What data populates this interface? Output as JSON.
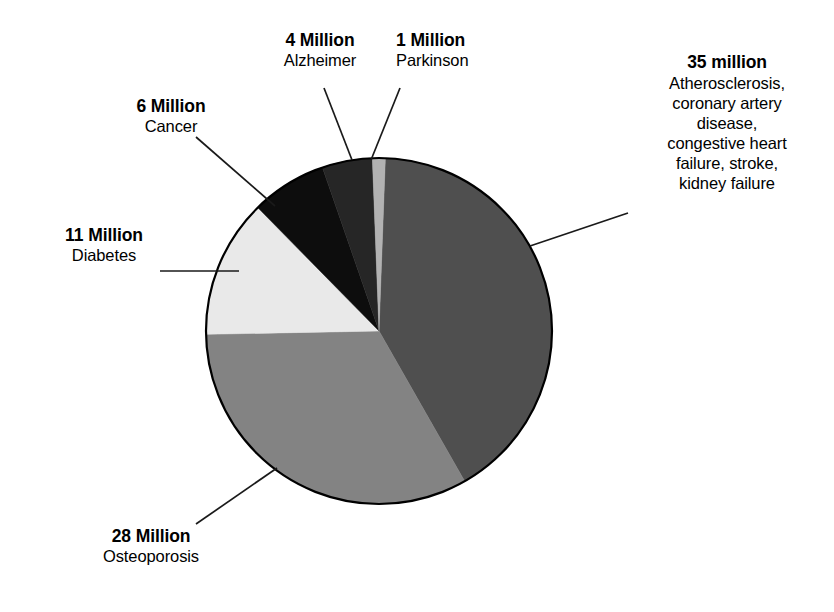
{
  "chart_data": {
    "type": "pie",
    "title": "",
    "units": "millions of people",
    "total": 85,
    "legend_position": "callouts",
    "grid": false,
    "categories": [
      "Atherosclerosis, coronary artery disease, congestive heart failure, stroke, kidney failure",
      "Osteoporosis",
      "Diabetes",
      "Cancer",
      "Alzheimer",
      "Parkinson"
    ],
    "values": [
      35,
      28,
      11,
      6,
      4,
      1
    ],
    "slices": [
      {
        "key": "atherosclerosis",
        "amount_label": "35 million",
        "desc_label": "Atherosclerosis, coronary artery disease, congestive heart failure, stroke, kidney failure",
        "desc_lines": [
          "Atherosclerosis,",
          "coronary artery",
          "disease,",
          "congestive heart",
          "failure, stroke,",
          "kidney failure"
        ],
        "value": 35,
        "percent": 41.2,
        "color": "#4f4f4f",
        "start_angle": 2.1,
        "sweep_angle": 148.2
      },
      {
        "key": "osteoporosis",
        "amount_label": "28 Million",
        "desc_label": "Osteoporosis",
        "desc_lines": [
          "Osteoporosis"
        ],
        "value": 28,
        "percent": 32.9,
        "color": "#838383",
        "start_angle": 150.3,
        "sweep_angle": 118.6
      },
      {
        "key": "diabetes",
        "amount_label": "11 Million",
        "desc_label": "Diabetes",
        "desc_lines": [
          "Diabetes"
        ],
        "value": 11,
        "percent": 12.9,
        "color": "#e9e9e9",
        "start_angle": 268.9,
        "sweep_angle": 46.6
      },
      {
        "key": "cancer",
        "amount_label": "6 Million",
        "desc_label": "Cancer",
        "desc_lines": [
          "Cancer"
        ],
        "value": 6,
        "percent": 7.1,
        "color": "#0d0d0d",
        "start_angle": 315.5,
        "sweep_angle": 25.4
      },
      {
        "key": "alzheimer",
        "amount_label": "4 Million",
        "desc_label": "Alzheimer",
        "desc_lines": [
          "Alzheimer"
        ],
        "value": 4,
        "percent": 4.7,
        "color": "#262626",
        "start_angle": 340.9,
        "sweep_angle": 16.9
      },
      {
        "key": "parkinson",
        "amount_label": "1 Million",
        "desc_label": "Parkinson",
        "desc_lines": [
          "Parkinson"
        ],
        "value": 1,
        "percent": 1.2,
        "color": "#b2b2b2",
        "start_angle": 357.8,
        "sweep_angle": 4.3
      }
    ],
    "geometry": {
      "center_x": 379,
      "center_y": 331,
      "radius": 173,
      "outline_color": "#000000"
    }
  },
  "callouts": {
    "parkinson": {
      "amount": "1 Million",
      "desc": "Parkinson"
    },
    "alzheimer": {
      "amount": "4 Million",
      "desc": "Alzheimer"
    },
    "cancer": {
      "amount": "6 Million",
      "desc": "Cancer"
    },
    "diabetes": {
      "amount": "11 Million",
      "desc": "Diabetes"
    },
    "osteoporosis": {
      "amount": "28 Million",
      "desc": "Osteoporosis"
    },
    "atherosclerosis": {
      "amount": "35 million",
      "line1": "Atherosclerosis,",
      "line2": "coronary artery",
      "line3": "disease,",
      "line4": "congestive heart",
      "line5": "failure, stroke,",
      "line6": "kidney failure"
    }
  }
}
